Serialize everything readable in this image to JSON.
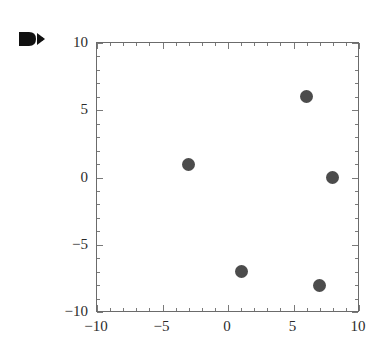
{
  "artifact": {
    "top_text": "",
    "marker_icon": "double-arrow-marker-icon"
  },
  "chart_data": {
    "type": "scatter",
    "title": "",
    "xlabel": "",
    "ylabel": "",
    "xlim": [
      -10,
      10
    ],
    "ylim": [
      -10,
      10
    ],
    "grid": false,
    "legend": null,
    "x_ticks": [
      -10,
      -5,
      0,
      5,
      10
    ],
    "y_ticks": [
      -10,
      -5,
      0,
      5,
      10
    ],
    "x_tick_labels": [
      "-10",
      "-5",
      "0",
      "5",
      "10"
    ],
    "y_tick_labels": [
      "-10",
      "-5",
      "0",
      "5",
      "10"
    ],
    "minor_tick_step": 1,
    "point_color": "#4c4c4c",
    "frame_color": "#6b6b6b",
    "points": [
      {
        "x": -3,
        "y": 1
      },
      {
        "x": 6,
        "y": 6
      },
      {
        "x": 8,
        "y": 0
      },
      {
        "x": 1,
        "y": -7
      },
      {
        "x": 7,
        "y": -8
      }
    ]
  }
}
